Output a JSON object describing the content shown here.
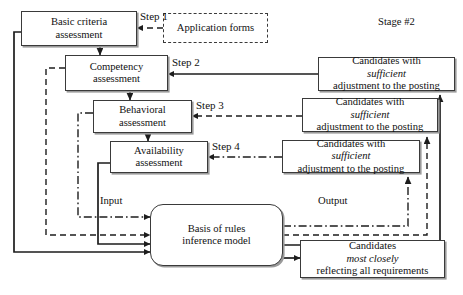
{
  "diagram": {
    "stage_label": "Stage #2",
    "process_boxes": [
      {
        "name": "basic-criteria",
        "line1": "Basic criteria",
        "line2": "assessment"
      },
      {
        "name": "competency",
        "line1": "Competency",
        "line2": "assessment"
      },
      {
        "name": "behavioral",
        "line1": "Behavioral",
        "line2": "assessment"
      },
      {
        "name": "availability",
        "line1": "Availability",
        "line2": "assessment"
      }
    ],
    "input_source": {
      "name": "application-forms",
      "label": "Application forms"
    },
    "step_labels": [
      {
        "name": "step-1",
        "label": "Step 1"
      },
      {
        "name": "step-2",
        "label": "Step 2"
      },
      {
        "name": "step-3",
        "label": "Step 3"
      },
      {
        "name": "step-4",
        "label": "Step 4"
      }
    ],
    "candidate_boxes": [
      {
        "name": "candidates-sufficient-1",
        "pre": "Candidates with ",
        "em": "sufficient",
        "line2": "adjustment to the posting"
      },
      {
        "name": "candidates-sufficient-2",
        "pre": "Candidates with ",
        "em": "sufficient",
        "line2": "adjustment to the posting"
      },
      {
        "name": "candidates-sufficient-3",
        "pre": "Candidates with ",
        "em": "sufficient",
        "line2": "adjustment to the posting"
      }
    ],
    "inference_model": {
      "line1": "Basis of rules",
      "line2": "inference model"
    },
    "io_labels": [
      {
        "name": "input-label",
        "label": "Input"
      },
      {
        "name": "output-label",
        "label": "Output"
      }
    ],
    "final_output": {
      "pre": "Candidates ",
      "em": "most closely",
      "line2": "reflecting all requirements"
    },
    "colors": {
      "stroke": "#3a3a3a",
      "text": "#111111",
      "shadow": "#9a9a9a"
    }
  }
}
